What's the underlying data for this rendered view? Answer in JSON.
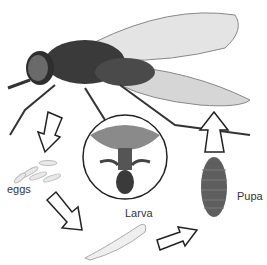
{
  "diagram": {
    "stages": [
      {
        "id": "adult",
        "label": ""
      },
      {
        "id": "eggs",
        "label": "eggs"
      },
      {
        "id": "larva",
        "label": "Larva"
      },
      {
        "id": "pupa",
        "label": "Pupa"
      }
    ],
    "inset": "magnified fly head (mouthparts)",
    "colors": {
      "outline": "#222222",
      "body": "#3a3a3a",
      "wing": "#c8c8c8"
    }
  }
}
